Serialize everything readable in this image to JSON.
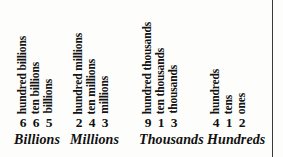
{
  "chart_data": {
    "type": "table",
    "groups": [
      {
        "period": "Billions",
        "columns": [
          {
            "place": "hundred billions",
            "digit": "6"
          },
          {
            "place": "ten billions",
            "digit": "6"
          },
          {
            "place": "billions",
            "digit": "5"
          }
        ]
      },
      {
        "period": "Millions",
        "columns": [
          {
            "place": "hundred millions",
            "digit": "2"
          },
          {
            "place": "ten millions",
            "digit": "4"
          },
          {
            "place": "millions",
            "digit": "3"
          }
        ]
      },
      {
        "period": "Thousands",
        "columns": [
          {
            "place": "hundred thousands",
            "digit": "9"
          },
          {
            "place": "ten thousands",
            "digit": "1"
          },
          {
            "place": "thousands",
            "digit": "3"
          }
        ]
      },
      {
        "period": "Hundreds",
        "columns": [
          {
            "place": "hundreds",
            "digit": "4"
          },
          {
            "place": "tens",
            "digit": "1"
          },
          {
            "place": "ones",
            "digit": "2"
          }
        ]
      }
    ]
  },
  "colors": {
    "ink": "#121212",
    "paper": "#fdfdfc",
    "rule": "#3a3a3a"
  }
}
